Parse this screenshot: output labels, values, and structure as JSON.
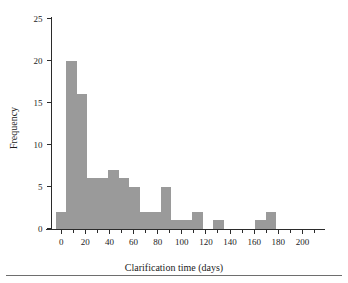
{
  "figure": {
    "background_color": "#ffffff",
    "bar_color": "#9a9a9a",
    "axis_color": "#2b2b2b",
    "rule_color": "#6e6e6e"
  },
  "chart_data": {
    "type": "bar",
    "chart_subtype": "histogram",
    "title": "",
    "xlabel": "Clarification time (days)",
    "ylabel": "Frequency",
    "xlim": [
      -8,
      215
    ],
    "ylim": [
      0,
      25
    ],
    "grid": false,
    "legend": null,
    "xticks": [
      0,
      20,
      40,
      60,
      80,
      100,
      120,
      140,
      160,
      180,
      200
    ],
    "xtick_labels": [
      "0",
      "20",
      "40",
      "60",
      "80",
      "100",
      "120",
      "140",
      "160",
      "180",
      "200"
    ],
    "minor_xtick_step": 10,
    "yticks": [
      0,
      5,
      10,
      15,
      20,
      25
    ],
    "ytick_labels": [
      "0",
      "5",
      "10",
      "15",
      "20",
      "25"
    ],
    "bin_width": 8.7,
    "bin_edges": [
      -4.3,
      4.3,
      13.0,
      21.7,
      30.4,
      39.1,
      47.8,
      56.5,
      65.2,
      73.9,
      82.6,
      91.3,
      100.0,
      108.7,
      117.4,
      126.1,
      134.8,
      143.5,
      152.2,
      160.9,
      169.6,
      178.3
    ],
    "categories": [
      "-4.3–4.3",
      "4.3–13.0",
      "13.0–21.7",
      "21.7–30.4",
      "30.4–39.1",
      "39.1–47.8",
      "47.8–56.5",
      "56.5–65.2",
      "65.2–73.9",
      "73.9–82.6",
      "82.6–91.3",
      "91.3–100.0",
      "100.0–108.7",
      "108.7–117.4",
      "117.4–126.1",
      "126.1–134.8",
      "134.8–143.5",
      "143.5–152.2",
      "152.2–160.9",
      "160.9–169.6",
      "169.6–178.3"
    ],
    "values": [
      2,
      20,
      16,
      6,
      6,
      7,
      6,
      5,
      2,
      2,
      5,
      1,
      1,
      2,
      0,
      1,
      0,
      0,
      0,
      1,
      2
    ]
  }
}
